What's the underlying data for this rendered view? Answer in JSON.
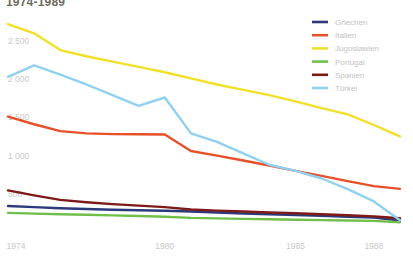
{
  "chart_data": {
    "type": "line",
    "title": "1974-1989",
    "xlabel": "",
    "ylabel": "",
    "grid": false,
    "legend_position": "top-right",
    "x": [
      1974,
      1975,
      1976,
      1977,
      1978,
      1979,
      1980,
      1981,
      1982,
      1983,
      1984,
      1985,
      1986,
      1987,
      1988,
      1989
    ],
    "xticks": [
      "1974",
      "1980",
      "1985",
      "1988"
    ],
    "xtick_values": [
      1974,
      1980,
      1985,
      1988
    ],
    "yticks": [
      "500",
      "1 000",
      "1 500",
      "2 000",
      "2 500"
    ],
    "ytick_values": [
      500,
      1000,
      1500,
      2000,
      2500
    ],
    "ylim": [
      0,
      2800
    ],
    "xlim": [
      1974,
      1989
    ],
    "series": [
      {
        "name": "Griechen",
        "color": "#2b3a7a",
        "values": [
          340,
          325,
          310,
          300,
          292,
          285,
          278,
          268,
          255,
          243,
          232,
          222,
          212,
          200,
          188,
          150
        ]
      },
      {
        "name": "Italien",
        "color": "#e8502a",
        "values": [
          1510,
          1410,
          1320,
          1290,
          1280,
          1278,
          1275,
          1060,
          1000,
          935,
          870,
          800,
          735,
          665,
          600,
          565
        ]
      },
      {
        "name": "Jugoslawien",
        "color": "#f2e028",
        "values": [
          2720,
          2600,
          2380,
          2300,
          2230,
          2160,
          2090,
          2010,
          1930,
          1860,
          1790,
          1710,
          1620,
          1540,
          1400,
          1250
        ]
      },
      {
        "name": "Portugal",
        "color": "#6fbf4a",
        "values": [
          250,
          240,
          232,
          225,
          218,
          210,
          200,
          185,
          178,
          172,
          166,
          160,
          155,
          150,
          146,
          128
        ]
      },
      {
        "name": "Spanien",
        "color": "#7d1a1a",
        "values": [
          545,
          480,
          420,
          390,
          365,
          345,
          325,
          295,
          280,
          268,
          255,
          245,
          232,
          220,
          205,
          180
        ]
      },
      {
        "name": "Türkei",
        "color": "#8fd1ef",
        "values": [
          2030,
          2180,
          2060,
          1930,
          1790,
          1650,
          1760,
          1290,
          1180,
          1030,
          880,
          800,
          700,
          560,
          400,
          155
        ]
      }
    ]
  },
  "axis": {
    "ytick_color": "#c8c8c8",
    "xtick_color": "#c8c8c8"
  },
  "legend": {
    "items": [
      {
        "label": "Griechen",
        "color": "#2b3a7a"
      },
      {
        "label": "Italien",
        "color": "#e8502a"
      },
      {
        "label": "Jugoslawien",
        "color": "#f2e028"
      },
      {
        "label": "Portugal",
        "color": "#6fbf4a"
      },
      {
        "label": "Spanien",
        "color": "#7d1a1a"
      },
      {
        "label": "Türkei",
        "color": "#8fd1ef"
      }
    ]
  }
}
